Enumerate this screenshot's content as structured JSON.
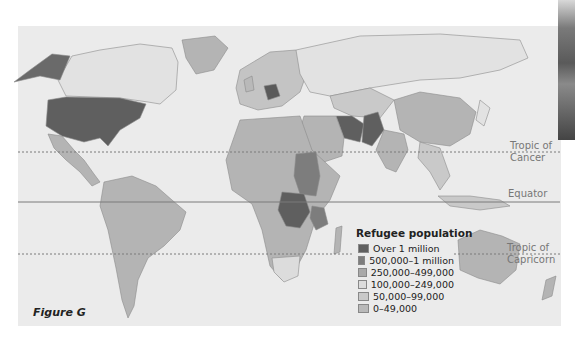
{
  "figure": {
    "label": "Figure G"
  },
  "latitude_lines": {
    "tropic_of_cancer": {
      "line1": "Tropic of",
      "line2": "Cancer",
      "style": "dotted"
    },
    "equator": {
      "label": "Equator",
      "style": "solid"
    },
    "tropic_of_capricorn": {
      "line1": "Tropic of",
      "line2": "Capricorn",
      "style": "dotted"
    }
  },
  "legend": {
    "title": "Refugee population",
    "items": [
      {
        "label": "Over 1 million",
        "color": "#5f5f5f"
      },
      {
        "label": "500,000–1 million",
        "color": "#7d7d7d"
      },
      {
        "label": "250,000–499,000",
        "color": "#a9a9a9"
      },
      {
        "label": "100,000–249,000",
        "color": "#dcdcdc"
      },
      {
        "label": "50,000–99,000",
        "color": "#c9c9c9"
      },
      {
        "label": "0–49,000",
        "color": "#b9b9b9"
      }
    ]
  },
  "highlighted_regions": {
    "over_1_million": [
      "Germany",
      "Iran",
      "Pakistan",
      "DR Congo",
      "United States"
    ],
    "500000_1_million": [
      "Sudan",
      "Tanzania"
    ]
  },
  "colors": {
    "background": "#ffffff",
    "map_background": "#ebebeb",
    "land_light": "#e2e2e2",
    "land_mid": "#b4b4b4",
    "land_dark": "#5f5f5f",
    "border": "#8c8c8c",
    "lat_line": "#7a7a7a"
  }
}
